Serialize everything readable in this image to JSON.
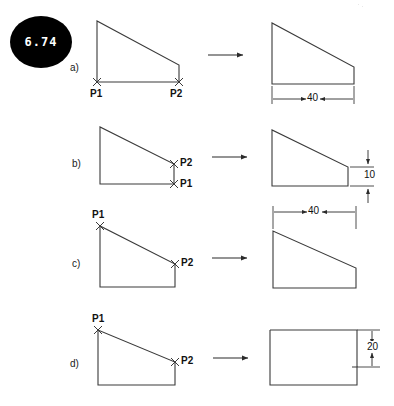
{
  "figure": {
    "badge_number": "6.74",
    "background_color": "#ffffff",
    "line_color": "#333333",
    "text_color": "#111111",
    "badge_color": "#000000",
    "badge_text_color": "#ffffff"
  },
  "rows": [
    {
      "id": "a",
      "label": "a)",
      "point_labels": [
        {
          "name": "P1",
          "text": "P1"
        },
        {
          "name": "P2",
          "text": "P2"
        }
      ],
      "arrow": "right-arrow",
      "dimensions": [
        {
          "name": "width-dimension",
          "value": "40",
          "orientation": "horizontal"
        }
      ]
    },
    {
      "id": "b",
      "label": "b)",
      "point_labels": [
        {
          "name": "P2",
          "text": "P2"
        },
        {
          "name": "P1",
          "text": "P1"
        }
      ],
      "arrow": "right-arrow",
      "dimensions": [
        {
          "name": "height-dimension",
          "value": "10",
          "orientation": "vertical"
        }
      ]
    },
    {
      "id": "c",
      "label": "c)",
      "point_labels": [
        {
          "name": "P1",
          "text": "P1"
        },
        {
          "name": "P2",
          "text": "P2"
        }
      ],
      "arrow": "right-arrow",
      "dimensions": [
        {
          "name": "width-dimension",
          "value": "40",
          "orientation": "horizontal"
        }
      ]
    },
    {
      "id": "d",
      "label": "d)",
      "point_labels": [
        {
          "name": "P1",
          "text": "P1"
        },
        {
          "name": "P2",
          "text": "P2"
        }
      ],
      "arrow": "right-arrow",
      "dimensions": [
        {
          "name": "height-dimension",
          "value": "20",
          "orientation": "vertical"
        }
      ]
    }
  ]
}
